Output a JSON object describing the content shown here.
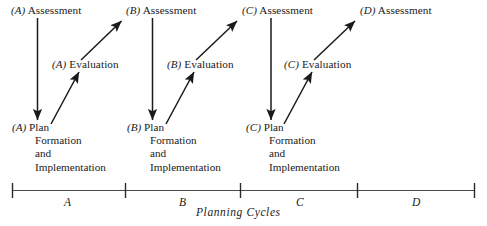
{
  "figure": {
    "type": "process-cycle-timeline-diagram",
    "axis_caption": "Planning Cycles",
    "cycles": [
      {
        "tag": "(A)",
        "assessment": "Assessment",
        "evaluation": "Evaluation",
        "plan_line1": "Plan",
        "plan_line2": "Formation",
        "plan_line3": "and",
        "plan_line4": "Implementation",
        "axis_tick_label": "A"
      },
      {
        "tag": "(B)",
        "assessment": "Assessment",
        "evaluation": "Evaluation",
        "plan_line1": "Plan",
        "plan_line2": "Formation",
        "plan_line3": "and",
        "plan_line4": "Implementation",
        "axis_tick_label": "B"
      },
      {
        "tag": "(C)",
        "assessment": "Assessment",
        "evaluation": "Evaluation",
        "plan_line1": "Plan",
        "plan_line2": "Formation",
        "plan_line3": "and",
        "plan_line4": "Implementation",
        "axis_tick_label": "C"
      },
      {
        "tag": "(D)",
        "assessment": "Assessment",
        "evaluation": null,
        "plan_line1": null,
        "plan_line2": null,
        "plan_line3": null,
        "plan_line4": null,
        "axis_tick_label": "D"
      }
    ],
    "colors": {
      "ink": "#1a1a1a",
      "axis": "#4a4a4a",
      "background": "#ffffff"
    }
  }
}
